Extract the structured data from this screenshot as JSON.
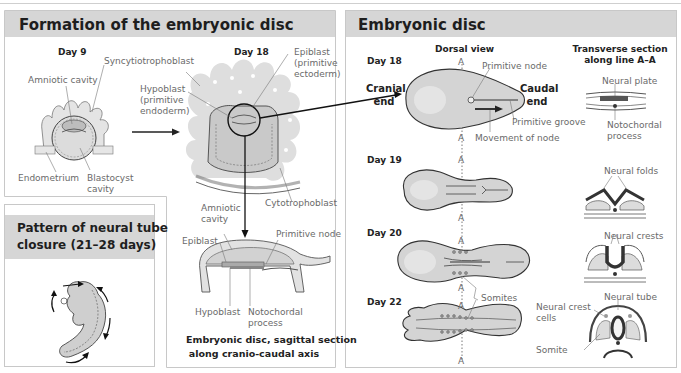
{
  "panels": {
    "formation": {
      "title": "Formation of the embryonic disc",
      "day9": {
        "label": "Day 9",
        "labels": {
          "syncytiotrophoblast": "Syncytiotrophoblast",
          "amniotic_cavity": "Amniotic cavity",
          "endometrium": "Endometrium",
          "blastocyst_cavity": "Blastocyst\ncavity"
        }
      },
      "day18": {
        "label": "Day 18",
        "labels": {
          "epiblast": "Epiblast\n(primitive\nectoderm)",
          "hypoblast": "Hypoblast\n(primitive\nendoderm)",
          "cytotrophoblast": "Cytotrophoblast"
        }
      },
      "sagittal": {
        "labels": {
          "amniotic_cavity": "Amniotic\ncavity",
          "epiblast": "Epiblast",
          "primitive_node": "Primitive node",
          "hypoblast": "Hypoblast",
          "notochordal_process": "Notochordal\nprocess"
        },
        "caption": "Embryonic disc, sagittal section\nalong cranio-caudal axis"
      }
    },
    "neural_tube": {
      "title": "Pattern of neural tube\nclosure (21–28 days)"
    },
    "embryonic_disc": {
      "title": "Embryonic disc",
      "column_headers": {
        "dorsal": "Dorsal view",
        "transverse": "Transverse section\nalong line A–A"
      },
      "axis_marker": "A",
      "rows": [
        {
          "day": "Day 18",
          "labels": {
            "cranial_end": "Cranial\nend",
            "caudal_end": "Caudal\nend",
            "primitive_node": "Primitive node",
            "primitive_groove": "Primitive groove",
            "movement_of_node": "Movement of node",
            "neural_plate": "Neural plate",
            "notochordal_process": "Notochordal\nprocess"
          }
        },
        {
          "day": "Day 19",
          "labels": {
            "neural_folds": "Neural folds"
          }
        },
        {
          "day": "Day 20",
          "labels": {
            "neural_crests": "Neural crests"
          }
        },
        {
          "day": "Day 22",
          "labels": {
            "somites": "Somites",
            "neural_tube": "Neural tube",
            "neural_crest_cells": "Neural crest\ncells",
            "somite": "Somite"
          }
        }
      ]
    }
  },
  "colors": {
    "header_bg": "#d6d6d6",
    "tissue_fill": "#cfcfcf",
    "tissue_stroke": "#444444",
    "neural_dark": "#555555",
    "label_gray": "#6a6a6a"
  }
}
